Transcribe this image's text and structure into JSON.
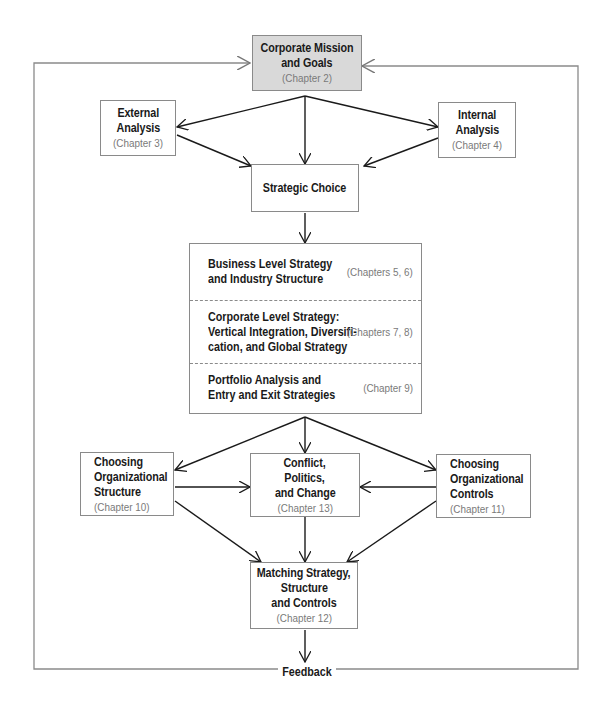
{
  "diagram": {
    "type": "strategic-management-process-flowchart",
    "boxes": {
      "mission": {
        "title_lines": [
          "Corporate Mission",
          "and Goals"
        ],
        "chapter": "(Chapter 2)",
        "fill": "#d9d9d9"
      },
      "external": {
        "title_lines": [
          "External",
          "Analysis"
        ],
        "chapter": "(Chapter 3)"
      },
      "internal": {
        "title_lines": [
          "Internal",
          "Analysis"
        ],
        "chapter": "(Chapter 4)"
      },
      "choice": {
        "title_lines": [
          "Strategic Choice"
        ]
      },
      "strategies": [
        {
          "title_lines": [
            "Business Level Strategy",
            "and Industry Structure"
          ],
          "chapter": "(Chapters 5, 6)"
        },
        {
          "title_lines": [
            "Corporate Level Strategy:",
            "Vertical Integration, Diversifi-",
            "cation, and Global Strategy"
          ],
          "chapter": "(Chapters 7, 8)"
        },
        {
          "title_lines": [
            "Portfolio Analysis and",
            "Entry and Exit Strategies"
          ],
          "chapter": "(Chapter 9)"
        }
      ],
      "structure": {
        "title_lines": [
          "Choosing",
          "Organizational",
          "Structure"
        ],
        "chapter": "(Chapter 10)"
      },
      "conflict": {
        "title_lines": [
          "Conflict,",
          "Politics,",
          "and Change"
        ],
        "chapter": "(Chapter 13)"
      },
      "controls": {
        "title_lines": [
          "Choosing",
          "Organizational",
          "Controls"
        ],
        "chapter": "(Chapter 11)"
      },
      "matching": {
        "title_lines": [
          "Matching Strategy,",
          "Structure",
          "and Controls"
        ],
        "chapter": "(Chapter 12)"
      }
    },
    "feedback_label": "Feedback",
    "edges": [
      [
        "mission",
        "external"
      ],
      [
        "mission",
        "choice"
      ],
      [
        "mission",
        "internal"
      ],
      [
        "external",
        "choice"
      ],
      [
        "internal",
        "choice"
      ],
      [
        "choice",
        "strategies"
      ],
      [
        "strategies",
        "structure"
      ],
      [
        "strategies",
        "conflict"
      ],
      [
        "strategies",
        "controls"
      ],
      [
        "structure",
        "conflict"
      ],
      [
        "controls",
        "conflict"
      ],
      [
        "structure",
        "matching"
      ],
      [
        "conflict",
        "matching"
      ],
      [
        "controls",
        "matching"
      ],
      [
        "matching",
        "feedback"
      ],
      [
        "feedback",
        "mission"
      ]
    ],
    "colors": {
      "line": "#1a1a1a",
      "border": "#8a8a8a",
      "chapter_text": "#7a7a7a",
      "loop": "#8a8a8a"
    }
  }
}
